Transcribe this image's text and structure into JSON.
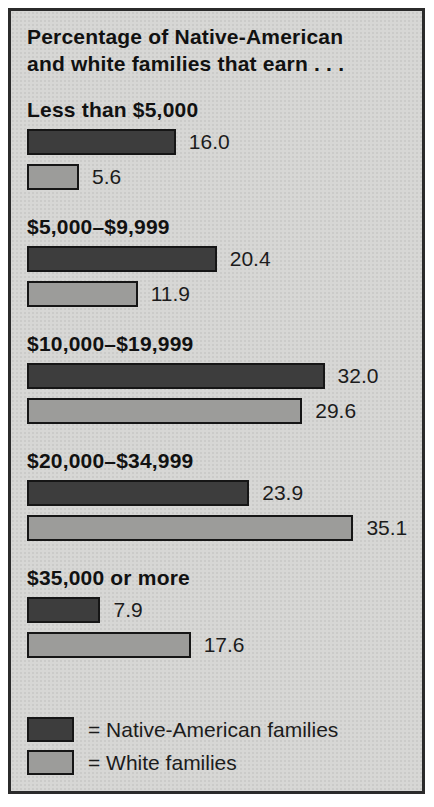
{
  "panel": {
    "background_color": "#d7d7d5",
    "border_color": "#2b2b2b"
  },
  "chart_data": {
    "type": "bar",
    "orientation": "horizontal",
    "title": "Percentage of Native-American and white families that earn . . .",
    "title_line1": "Percentage of Native-American",
    "title_line2": "and white families that earn . . .",
    "categories": [
      "Less than $5,000",
      "$5,000–$9,999",
      "$10,000–$19,999",
      "$20,000–$34,999",
      "$35,000 or more"
    ],
    "series": [
      {
        "name": "Native-American families",
        "color": "#3d3d3d",
        "values": [
          16.0,
          20.4,
          32.0,
          23.9,
          7.9
        ],
        "labels": [
          "16.0",
          "20.4",
          "32.0",
          "23.9",
          "7.9"
        ]
      },
      {
        "name": "White families",
        "color": "#9c9c9a",
        "values": [
          5.6,
          11.9,
          29.6,
          35.1,
          17.6
        ],
        "labels": [
          "5.6",
          "11.9",
          "29.6",
          "35.1",
          "17.6"
        ]
      }
    ],
    "xlim": [
      0,
      38
    ],
    "value_labels": true,
    "grid": false,
    "axes_shown": false,
    "legend_position": "bottom"
  },
  "legend": {
    "items": [
      {
        "label": "= Native-American families",
        "color": "#3d3d3d"
      },
      {
        "label": "= White families",
        "color": "#9c9c9a"
      }
    ]
  }
}
